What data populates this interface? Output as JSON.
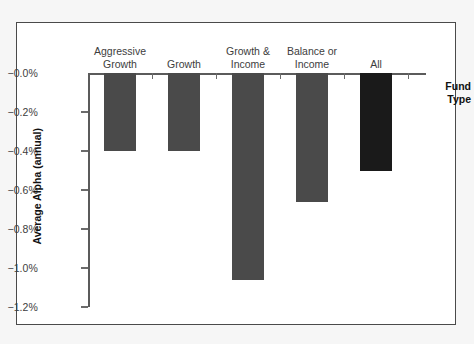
{
  "chart_data": {
    "type": "bar",
    "title": "",
    "xlabel": "Fund Type",
    "ylabel": "Average Alpha (annual)",
    "categories": [
      "Aggressive Growth",
      "Growth",
      "Growth & Income",
      "Balance or Income",
      "All"
    ],
    "category_lines": [
      [
        "Aggressive",
        "Growth"
      ],
      [
        "Growth"
      ],
      [
        "Growth &",
        "Income"
      ],
      [
        "Balance or",
        "Income"
      ],
      [
        "All"
      ]
    ],
    "values": [
      -0.4,
      -0.4,
      -1.06,
      -0.66,
      -0.5
    ],
    "value_labels": [
      "-0.40%",
      "-0.40%",
      "-1.06%",
      "-0.66%",
      "-0.50%"
    ],
    "ylim": [
      -1.2,
      0.0
    ],
    "ytick_values": [
      0.0,
      -0.2,
      -0.4,
      -0.6,
      -0.8,
      -1.0,
      -1.2
    ],
    "ytick_labels": [
      "−0.0%",
      "−0.2%",
      "−0.4%",
      "−0.6%",
      "−0.8%",
      "−1.0%",
      "−1.2%"
    ],
    "grid": false,
    "legend": "none",
    "bar_colors": [
      "#4a4a4a",
      "#4a4a4a",
      "#4a4a4a",
      "#4a4a4a",
      "#1a1a1a"
    ],
    "axis_color": "#5b5b5b",
    "frame_color": "#4a4a4a",
    "background": "#ffffff",
    "orientation": "vertical-downward"
  },
  "axis_titles": {
    "x": "Fund\nType",
    "y": "Average Alpha (annual)"
  }
}
